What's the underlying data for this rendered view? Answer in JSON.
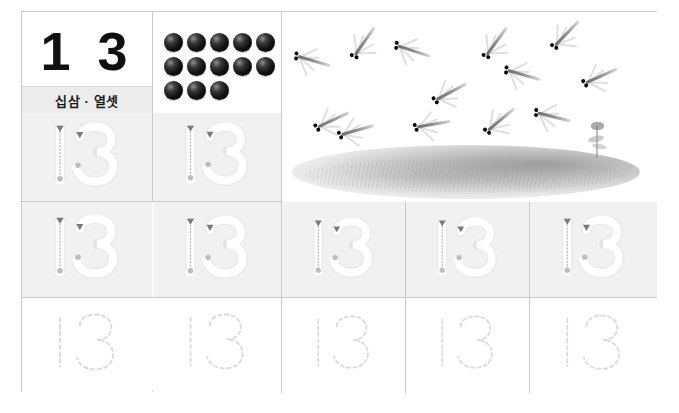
{
  "worksheet": {
    "title": "Number 13 tracing worksheet",
    "number_display": "1 3",
    "number_value": 13,
    "korean_reading": "십삼 · 열셋",
    "counter_label": "13 dots"
  },
  "dots_panel": {
    "name": "counting-dots",
    "total": 13,
    "rows": [
      5,
      5,
      3
    ],
    "color": "#000000"
  },
  "illustration": {
    "name": "dragonflies-over-grass",
    "subject": "dragonflies",
    "count": 13,
    "scenery": "grass field with reed",
    "dragonflies": [
      {
        "x": 8,
        "y": 36,
        "rot": 16
      },
      {
        "x": 60,
        "y": 18,
        "rot": -55
      },
      {
        "x": 28,
        "y": 96,
        "rot": -25
      },
      {
        "x": 108,
        "y": 26,
        "rot": 18
      },
      {
        "x": 52,
        "y": 106,
        "rot": -16
      },
      {
        "x": 146,
        "y": 68,
        "rot": -28
      },
      {
        "x": 192,
        "y": 18,
        "rot": -54
      },
      {
        "x": 128,
        "y": 100,
        "rot": -10
      },
      {
        "x": 218,
        "y": 50,
        "rot": 16
      },
      {
        "x": 196,
        "y": 96,
        "rot": -40
      },
      {
        "x": 262,
        "y": 10,
        "rot": -46
      },
      {
        "x": 248,
        "y": 92,
        "rot": 14
      },
      {
        "x": 296,
        "y": 52,
        "rot": -24
      }
    ]
  },
  "rows": [
    {
      "name": "trace-row-guided-1",
      "style": "guided",
      "background": "#f1f1f1",
      "cells": [
        {
          "label": "13",
          "guides": true
        },
        {
          "label": "13",
          "guides": true
        }
      ]
    },
    {
      "name": "trace-row-guided-2",
      "style": "guided",
      "background": "#f1f1f1",
      "cells": [
        {
          "label": "13",
          "guides": true
        },
        {
          "label": "13",
          "guides": true
        },
        {
          "label": "13",
          "guides": true
        },
        {
          "label": "13",
          "guides": true
        },
        {
          "label": "13",
          "guides": true
        }
      ]
    },
    {
      "name": "trace-row-dashed",
      "style": "dashed",
      "background": "#ffffff",
      "cells": [
        {
          "label": "13",
          "guides": false
        },
        {
          "label": "13",
          "guides": false
        },
        {
          "label": "13",
          "guides": false
        },
        {
          "label": "13",
          "guides": false
        },
        {
          "label": "13",
          "guides": false
        }
      ]
    }
  ],
  "colors": {
    "grid_line": "#c9c9c9",
    "cell_gray": "#f1f1f1",
    "trace_outline": "#ffffff",
    "trace_dashed": "#dcdcdc",
    "start_marker": "#7a7a7a",
    "end_marker": "#bdbdbd",
    "word_band": "#ececec",
    "text": "#101010"
  }
}
